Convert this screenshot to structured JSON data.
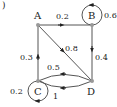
{
  "diagram": {
    "panel_label": ")",
    "type": "markov-chain",
    "colors": {
      "edge": "#555555",
      "node": "#999999",
      "text": "#222222"
    },
    "nodes": [
      {
        "id": "A",
        "label": "A"
      },
      {
        "id": "B",
        "label": "B"
      },
      {
        "id": "C",
        "label": "C"
      },
      {
        "id": "D",
        "label": "D"
      }
    ],
    "edges": [
      {
        "from": "A",
        "to": "B",
        "weight": "0.2"
      },
      {
        "from": "B",
        "to": "B",
        "weight": "0.6"
      },
      {
        "from": "A",
        "to": "D",
        "weight": "0.8"
      },
      {
        "from": "B",
        "to": "D",
        "weight": "0.4"
      },
      {
        "from": "C",
        "to": "A",
        "weight": "0.3"
      },
      {
        "from": "D",
        "to": "C",
        "weight": "0.5"
      },
      {
        "from": "D",
        "to": "C",
        "weight": "1"
      },
      {
        "from": "C",
        "to": "C",
        "weight": "0.2"
      }
    ]
  }
}
